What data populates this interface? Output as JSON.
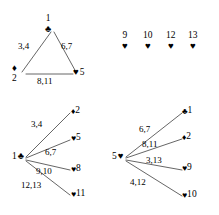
{
  "figure": {
    "suits": {
      "club": "♣",
      "diamond": "♦",
      "heart": "♥"
    },
    "line_color": "#555555",
    "text_color": "#000000",
    "background": "#ffffff"
  },
  "panels": {
    "triangle": {
      "name": "triangle-graph",
      "vertices": [
        {
          "id": "t-apex",
          "number": "1",
          "suit": "♣",
          "order": "number-above-suit",
          "x": 49,
          "y": 22
        },
        {
          "id": "t-left",
          "number": "2",
          "suit": "♦",
          "order": "suit-above-number",
          "x": 16,
          "y": 74
        },
        {
          "id": "t-right",
          "number": "5",
          "suit": "♥",
          "order": "suit-then-number",
          "x": 76,
          "y": 74
        }
      ],
      "edges": [
        {
          "from": "t-apex",
          "to": "t-left",
          "label": "3,4",
          "lx": 18,
          "ly": 44
        },
        {
          "from": "t-apex",
          "to": "t-right",
          "label": "6,7",
          "lx": 62,
          "ly": 44
        },
        {
          "from": "t-left",
          "to": "t-right",
          "label": "8,11",
          "lx": 38,
          "ly": 79
        }
      ]
    },
    "isolated": {
      "name": "isolated-hearts-row",
      "vertices": [
        {
          "id": "i-9",
          "number": "9",
          "suit": "♥",
          "x": 125,
          "y": 36
        },
        {
          "id": "i-10",
          "number": "10",
          "suit": "♥",
          "x": 145,
          "y": 36
        },
        {
          "id": "i-12",
          "number": "12",
          "suit": "♥",
          "x": 168,
          "y": 36
        },
        {
          "id": "i-13",
          "number": "13",
          "suit": "♥",
          "x": 190,
          "y": 36
        }
      ]
    },
    "star_left": {
      "name": "star-graph-club-one",
      "center": {
        "id": "sl-center",
        "number": "1",
        "suit": "♣",
        "order": "number-then-suit",
        "x": 13,
        "y": 156
      },
      "leaves": [
        {
          "id": "sl-2",
          "number": "2",
          "suit": "♦",
          "x": 74,
          "y": 112,
          "label": "3,4",
          "lx": 32,
          "ly": 125
        },
        {
          "id": "sl-5",
          "number": "5",
          "suit": "♥",
          "x": 74,
          "y": 139,
          "label": "6,7",
          "lx": 46,
          "ly": 153
        },
        {
          "id": "sl-8",
          "number": "8",
          "suit": "♥",
          "x": 74,
          "y": 170,
          "label": "9,10",
          "lx": 37,
          "ly": 172
        },
        {
          "id": "sl-11",
          "number": "11",
          "suit": "♥",
          "x": 74,
          "y": 195,
          "label": "12,13",
          "lx": 23,
          "ly": 186
        }
      ]
    },
    "star_right": {
      "name": "star-graph-heart-five",
      "center": {
        "id": "sr-center",
        "number": "5",
        "suit": "♥",
        "order": "number-then-suit",
        "x": 113,
        "y": 156
      },
      "leaves": [
        {
          "id": "sr-1",
          "number": "1",
          "suit": "♣",
          "x": 186,
          "y": 112,
          "label": "6,7",
          "lx": 140,
          "ly": 130
        },
        {
          "id": "sr-2",
          "number": "2",
          "suit": "♦",
          "x": 186,
          "y": 138,
          "label": "8,11",
          "lx": 143,
          "ly": 145
        },
        {
          "id": "sr-9",
          "number": "9",
          "suit": "♥",
          "x": 186,
          "y": 169,
          "label": "3,13",
          "lx": 147,
          "ly": 161
        },
        {
          "id": "sr-10",
          "number": "10",
          "suit": "♥",
          "x": 186,
          "y": 196,
          "label": "4,12",
          "lx": 131,
          "ly": 183
        }
      ]
    }
  }
}
